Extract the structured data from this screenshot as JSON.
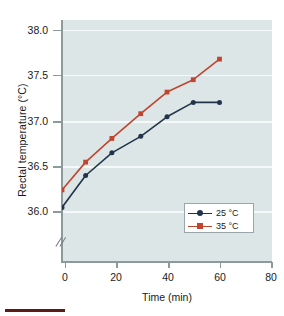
{
  "chart_data": {
    "type": "line",
    "title": "",
    "xlabel": "Time (min)",
    "ylabel": "Rectal temperature (°C)",
    "xlim": [
      0,
      80
    ],
    "ylim": [
      35.75,
      38.1
    ],
    "xticks": [
      0,
      20,
      40,
      60,
      80
    ],
    "xtick_labels": [
      "0",
      "20",
      "40",
      "60",
      "80"
    ],
    "yticks": [
      36.0,
      36.5,
      37.0,
      37.5,
      38.0
    ],
    "ytick_labels": [
      "36.0",
      "36.5",
      "37.0",
      "37.5",
      "38.0"
    ],
    "grid": "horizontal",
    "y_axis_break": true,
    "legend_position": "lower right",
    "series": [
      {
        "name": "25 °C",
        "color": "#22344c",
        "marker": "circle",
        "x": [
          0,
          9,
          19,
          30,
          40,
          50,
          60
        ],
        "values": [
          36.28,
          36.59,
          36.81,
          36.97,
          37.16,
          37.3,
          37.3
        ]
      },
      {
        "name": "35 °C",
        "color": "#c0452f",
        "marker": "square",
        "x": [
          0,
          9,
          19,
          30,
          40,
          50,
          60
        ],
        "values": [
          36.45,
          36.72,
          36.95,
          37.19,
          37.4,
          37.52,
          37.72
        ]
      }
    ]
  },
  "legend": {
    "items": [
      {
        "label": "25 °C",
        "color": "#22344c",
        "marker": "circle"
      },
      {
        "label": "35 °C",
        "color": "#c0452f",
        "marker": "square"
      }
    ]
  },
  "axes": {
    "y_title": "Rectal temperature (°C)",
    "x_title": "Time (min)",
    "ytick_0": "38.0",
    "ytick_1": "37.5",
    "ytick_2": "37.0",
    "ytick_3": "36.5",
    "ytick_4": "36.0",
    "xtick_0": "0",
    "xtick_1": "20",
    "xtick_2": "40",
    "xtick_3": "60",
    "xtick_4": "80"
  },
  "colors": {
    "plot_background": "#dde6e7",
    "gridline": "#f5f9f9",
    "axis": "#8d9a9d",
    "series_25": "#22344c",
    "series_35": "#c0452f",
    "bottom_rule": "#5c1d16"
  }
}
